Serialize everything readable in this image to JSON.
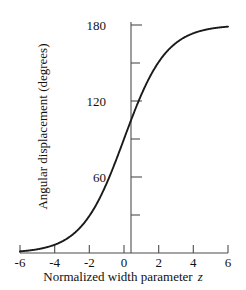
{
  "chart_data": {
    "type": "line",
    "title": "",
    "subtitle": "",
    "xlabel": "Normalized width parameter",
    "xlabel_symbol": "z",
    "ylabel": "Angular displacement  (degrees)",
    "xlim": [
      -6,
      6
    ],
    "ylim": [
      0,
      180
    ],
    "grid": false,
    "legend": null,
    "line_color": "#1a1a1a",
    "axis_color": "#4d4d4d",
    "xticks": [
      -6,
      -4,
      -2,
      0,
      2,
      4,
      6
    ],
    "xtick_labels": [
      "-6",
      "-4",
      "-2",
      "0",
      "2",
      "4",
      "6"
    ],
    "yticks": [
      0,
      30,
      60,
      90,
      120,
      150,
      180
    ],
    "ytick_labels": [
      "",
      "",
      "60",
      "",
      "120",
      "",
      "180"
    ],
    "series": [
      {
        "name": "angular displacement",
        "x": [
          -6.0,
          -5.5,
          -5.0,
          -4.5,
          -4.0,
          -3.5,
          -3.0,
          -2.5,
          -2.0,
          -1.5,
          -1.0,
          -0.5,
          0.0,
          0.5,
          1.0,
          1.5,
          2.0,
          2.5,
          3.0,
          3.5,
          4.0,
          4.5,
          5.0,
          5.5,
          6.0
        ],
        "y": [
          2.2,
          2.9,
          3.9,
          5.2,
          7.0,
          9.3,
          12.3,
          16.3,
          21.4,
          27.9,
          36.0,
          46.0,
          90.0,
          134.0,
          144.0,
          152.1,
          158.6,
          163.7,
          167.7,
          170.7,
          173.0,
          174.8,
          176.1,
          177.1,
          177.8
        ]
      }
    ],
    "curve_description": "Monotonic sigmoid rising from near 0 degrees at z = -6 through 90 degrees at z = 0 to an asymptote of 180 degrees near z = 6"
  },
  "axes": {
    "x_axis_name": "x-axis",
    "y_axis_name": "y-axis"
  }
}
